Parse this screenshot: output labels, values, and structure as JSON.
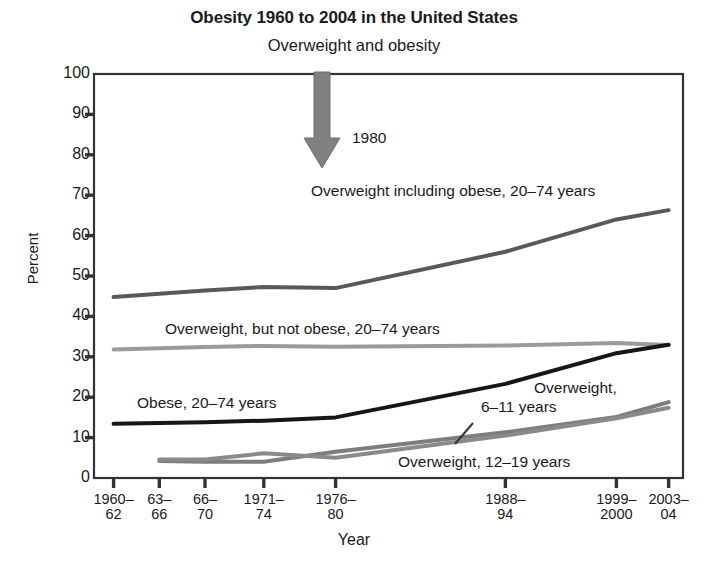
{
  "chart_data": {
    "type": "line",
    "title": "Obesity 1960 to 2004 in the United States",
    "subtitle": "Overweight and obesity",
    "xlabel": "Year",
    "ylabel": "Percent",
    "ylim": [
      0,
      100
    ],
    "ytick_labels": [
      "0",
      "10",
      "20",
      "30",
      "40",
      "50",
      "60",
      "70",
      "80",
      "90",
      "100"
    ],
    "yticks": [
      0,
      10,
      20,
      30,
      40,
      50,
      60,
      70,
      80,
      90,
      100
    ],
    "grid": false,
    "legend_position": "inline-annotations",
    "categories": [
      "1960-62",
      "63-66",
      "66-70",
      "1971-74",
      "1976-80",
      "1988-94",
      "1999-2000",
      "2003-04"
    ],
    "category_labels": [
      {
        "line1": "1960–",
        "line2": "62"
      },
      {
        "line1": "63–",
        "line2": "66"
      },
      {
        "line1": "66–",
        "line2": "70"
      },
      {
        "line1": "1971–",
        "line2": "74"
      },
      {
        "line1": "1976–",
        "line2": "80"
      },
      {
        "line1": "1988–",
        "line2": "94"
      },
      {
        "line1": "1999–",
        "line2": "2000"
      },
      {
        "line1": "2003–",
        "line2": "04"
      }
    ],
    "x_positions": [
      1961,
      1964.5,
      1968,
      1972.5,
      1978,
      1991,
      1999.5,
      2003.5
    ],
    "xlim": [
      1959.5,
      2004.6
    ],
    "series": [
      {
        "name": "Overweight including obese, 20–74 years",
        "color": "#595959",
        "width": 4,
        "x": [
          1961,
          1964.5,
          1968,
          1972.5,
          1978,
          1991,
          1999.5,
          2003.5
        ],
        "values": [
          44.8,
          45.6,
          46.4,
          47.3,
          47.0,
          56.0,
          64.0,
          66.3
        ]
      },
      {
        "name": "Overweight, but not obese, 20–74 years",
        "color": "#9a9a9a",
        "width": 4,
        "x": [
          1961,
          1964.5,
          1968,
          1972.5,
          1978,
          1991,
          1999.5,
          2003.5
        ],
        "values": [
          31.8,
          32.1,
          32.4,
          32.7,
          32.5,
          32.8,
          33.4,
          32.9
        ]
      },
      {
        "name": "Obese, 20–74 years",
        "color": "#161616",
        "width": 4,
        "x": [
          1961,
          1964.5,
          1968,
          1972.5,
          1978,
          1991,
          1999.5,
          2003.5
        ],
        "values": [
          13.4,
          13.6,
          13.8,
          14.2,
          15.0,
          23.3,
          30.9,
          33.0
        ]
      },
      {
        "name": "Overweight, 6–11 years",
        "color": "#7d7d7d",
        "width": 4,
        "x": [
          1964.5,
          1968,
          1972.5,
          1978,
          1991,
          1999.5,
          2003.5
        ],
        "values": [
          4.2,
          4.0,
          4.0,
          6.5,
          11.3,
          15.1,
          18.8
        ]
      },
      {
        "name": "Overweight, 12–19 years",
        "color": "#8a8a8a",
        "width": 4,
        "x": [
          1964.5,
          1968,
          1972.5,
          1978,
          1991,
          1999.5,
          2003.5
        ],
        "values": [
          4.6,
          4.6,
          6.1,
          5.0,
          10.5,
          14.8,
          17.4
        ]
      }
    ],
    "annotations": [
      {
        "id": "arrow-1980-label",
        "text": "1980",
        "x": 352,
        "y": 129
      },
      {
        "id": "label-overweight-including-obese",
        "text": "Overweight including obese, 20–74 years",
        "x": 311,
        "y": 182
      },
      {
        "id": "label-overweight-not-obese",
        "text": "Overweight, but not obese, 20–74 years",
        "x": 165,
        "y": 320
      },
      {
        "id": "label-obese",
        "text": "Obese, 20–74 years",
        "x": 137,
        "y": 394
      },
      {
        "id": "label-overweight-6-11-line1",
        "text": "Overweight,",
        "x": 534,
        "y": 379
      },
      {
        "id": "label-overweight-6-11-line2",
        "text": "6–11 years",
        "x": 481,
        "y": 398
      },
      {
        "id": "label-overweight-12-19",
        "text": "Overweight, 12–19 years",
        "x": 398,
        "y": 453
      }
    ],
    "arrow": {
      "name": "1980-marker-arrow",
      "color": "#808080",
      "x": 322,
      "top": 72,
      "bottom": 168
    },
    "axis_color": "#333333",
    "plot_area": {
      "left": 94,
      "right": 683,
      "top": 74,
      "bottom": 478
    }
  }
}
